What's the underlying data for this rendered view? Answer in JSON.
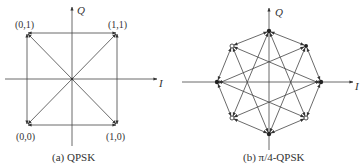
{
  "diagrams": {
    "qpsk": {
      "caption": "(a)  QPSK",
      "axis_i": "I",
      "axis_q": "Q",
      "points": [
        {
          "label": "(0,1)",
          "x": -1,
          "y": 1
        },
        {
          "label": "(1,1)",
          "x": 1,
          "y": 1
        },
        {
          "label": "(0,0)",
          "x": -1,
          "y": -1
        },
        {
          "label": "(1,0)",
          "x": 1,
          "y": -1
        }
      ]
    },
    "pi4_qpsk": {
      "caption": "(b)  π/4-QPSK",
      "axis_i": "I",
      "axis_q": "Q",
      "points_filled": [
        "0°",
        "90°",
        "180°",
        "270°"
      ],
      "points_open": [
        "45°",
        "135°",
        "225°",
        "315°"
      ]
    }
  }
}
